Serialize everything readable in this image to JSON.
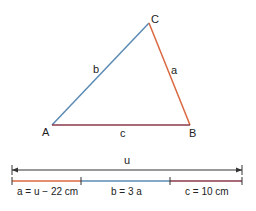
{
  "triangle": {
    "vertices": {
      "A": "A",
      "B": "B",
      "C": "C"
    },
    "sides": {
      "a": "a",
      "b": "b",
      "c": "c"
    }
  },
  "scale_bar": {
    "total_label": "u",
    "segments": [
      {
        "label": "a = u − 22 cm"
      },
      {
        "label": "b = 3 a"
      },
      {
        "label": "c = 10 cm"
      }
    ]
  },
  "colors": {
    "side_a": "#d9683f",
    "side_b": "#5b8bb5",
    "side_c": "#8a3a4a",
    "arrow": "#333333"
  }
}
